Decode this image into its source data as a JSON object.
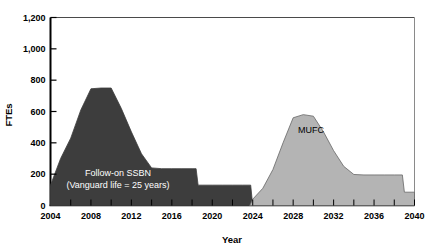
{
  "chart_data": {
    "type": "area",
    "title": "",
    "subtitle": "",
    "xlabel": "Year",
    "ylabel": "FTEs",
    "xlim": [
      2004,
      2040
    ],
    "ylim": [
      0,
      1200
    ],
    "grid": false,
    "legend": "none (inline series labels)",
    "x_tick_labels": [
      "2004",
      "2008",
      "2012",
      "2016",
      "2020",
      "2024",
      "2028",
      "2032",
      "2036",
      "2040"
    ],
    "x_tick_values": [
      2004,
      2008,
      2012,
      2016,
      2020,
      2024,
      2028,
      2032,
      2036,
      2040
    ],
    "x_minor_tick_values": [
      2006,
      2010,
      2014,
      2018,
      2022,
      2026,
      2030,
      2034,
      2038
    ],
    "y_tick_labels": [
      "0",
      "200",
      "400",
      "600",
      "800",
      "1,000",
      "1,200"
    ],
    "y_tick_values": [
      0,
      200,
      400,
      600,
      800,
      1000,
      1200
    ],
    "series": [
      {
        "name": "Follow-on SSBN",
        "inline_label_line1": "Follow-on SSBN",
        "inline_label_line2": "(Vanguard life = 25 years)",
        "color": "#3d3d3d",
        "label_color": "#ffffff",
        "x": [
          2004,
          2005,
          2006,
          2007,
          2008,
          2009,
          2010,
          2011,
          2012,
          2013,
          2014,
          2015,
          2016,
          2017,
          2018,
          2018.4,
          2018.6,
          2019,
          2020,
          2021,
          2022,
          2023,
          2023.8,
          2024
        ],
        "values": [
          130,
          300,
          430,
          610,
          745,
          750,
          750,
          620,
          470,
          330,
          240,
          235,
          235,
          235,
          235,
          235,
          130,
          130,
          130,
          130,
          130,
          130,
          130,
          0
        ]
      },
      {
        "name": "MUFC",
        "inline_label_line1": "MUFC",
        "inline_label_line2": "",
        "color": "#b4b4b4",
        "label_color": "#000000",
        "x": [
          2023.7,
          2024,
          2025,
          2026,
          2027,
          2028,
          2029,
          2030,
          2031,
          2032,
          2033,
          2034,
          2035,
          2036,
          2037,
          2038,
          2038.8,
          2039,
          2040
        ],
        "values": [
          0,
          40,
          110,
          230,
          400,
          560,
          580,
          570,
          470,
          350,
          250,
          198,
          195,
          195,
          195,
          195,
          195,
          85,
          85
        ]
      }
    ]
  }
}
